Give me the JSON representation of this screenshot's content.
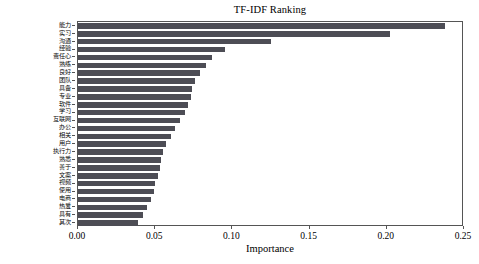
{
  "chart_data": {
    "type": "bar",
    "orientation": "horizontal",
    "title": "TF-IDF Ranking",
    "xlabel": "Importance",
    "ylabel": "",
    "xlim": [
      0.0,
      0.25
    ],
    "xticks": [
      "0.00",
      "0.05",
      "0.10",
      "0.15",
      "0.20",
      "0.25"
    ],
    "xtick_values": [
      0.0,
      0.05,
      0.1,
      0.15,
      0.2,
      0.25
    ],
    "grid": false,
    "legend": null,
    "bar_color": "#4d4d55",
    "categories": [
      "能力",
      "实习",
      "沟通",
      "经验",
      "责任心",
      "熟练",
      "良好",
      "团队",
      "具备",
      "专业",
      "软件",
      "学习",
      "互联网",
      "办公",
      "相关",
      "用户",
      "执行力",
      "熟悉",
      "善于",
      "文案",
      "视频",
      "使用",
      "电商",
      "热爱",
      "具有",
      "其次"
    ],
    "values": [
      0.238,
      0.202,
      0.125,
      0.095,
      0.087,
      0.083,
      0.079,
      0.076,
      0.074,
      0.073,
      0.071,
      0.069,
      0.066,
      0.063,
      0.06,
      0.057,
      0.055,
      0.054,
      0.053,
      0.052,
      0.05,
      0.049,
      0.047,
      0.045,
      0.042,
      0.039
    ]
  },
  "figure": {
    "background": "#ffffff",
    "axis_color": "#555555"
  }
}
